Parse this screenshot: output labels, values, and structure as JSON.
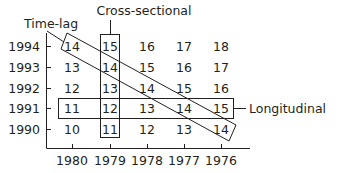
{
  "labels": {
    "time_lag": "Time-lag",
    "cross_sectional": "Cross-sectional",
    "longitudinal": "Longitudinal"
  },
  "y_axis": {
    "ticks": [
      "1994",
      "1993",
      "1992",
      "1991",
      "1990"
    ]
  },
  "x_axis": {
    "ticks": [
      "1980",
      "1979",
      "1978",
      "1977",
      "1976"
    ]
  },
  "grid": [
    [
      "14",
      "15",
      "16",
      "17",
      "18"
    ],
    [
      "13",
      "14",
      "15",
      "16",
      "17"
    ],
    [
      "12",
      "13",
      "14",
      "15",
      "16"
    ],
    [
      "11",
      "12",
      "13",
      "14",
      "15"
    ],
    [
      "10",
      "11",
      "12",
      "13",
      "14"
    ]
  ]
}
